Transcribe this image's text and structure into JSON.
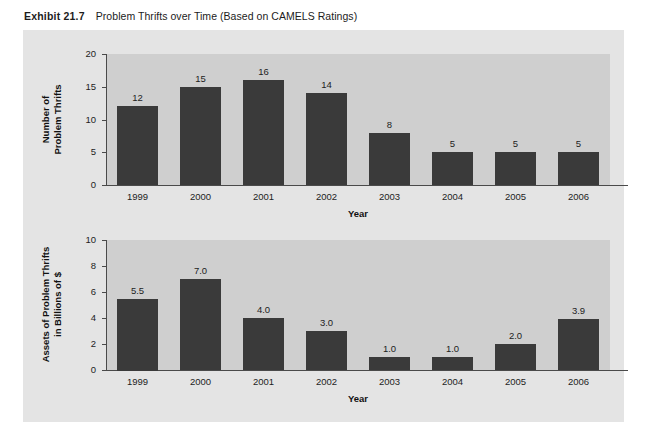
{
  "exhibit": {
    "number": "Exhibit 21.7",
    "caption": "Problem Thrifts over Time (Based on CAMELS Ratings)"
  },
  "colors": {
    "bar": "#3a3a3a",
    "panel_background": "#e4e4e4",
    "plot_background": "#cfcfcf",
    "axis": "#4a4a4a",
    "text": "#1d1d1d"
  },
  "chart_data": [
    {
      "type": "bar",
      "title": "",
      "xlabel": "Year",
      "ylabel": "Number of\nProblem Thrifts",
      "ylabel_line1": "Number of",
      "ylabel_line2": "Problem Thrifts",
      "categories": [
        "1999",
        "2000",
        "2001",
        "2002",
        "2003",
        "2004",
        "2005",
        "2006"
      ],
      "values": [
        12,
        15,
        16,
        14,
        8,
        5,
        5,
        5
      ],
      "value_labels": [
        "12",
        "15",
        "16",
        "14",
        "8",
        "5",
        "5",
        "5"
      ],
      "ylim": [
        0,
        20
      ],
      "yticks": [
        0,
        5,
        10,
        15,
        20
      ],
      "ytick_labels": [
        "0",
        "5",
        "10",
        "15",
        "20"
      ],
      "grid": false,
      "legend": "none"
    },
    {
      "type": "bar",
      "title": "",
      "xlabel": "Year",
      "ylabel": "Assets of Problem Thrifts\nin Billions of $",
      "ylabel_line1": "Assets of Problem Thrifts",
      "ylabel_line2": "in Billions of $",
      "categories": [
        "1999",
        "2000",
        "2001",
        "2002",
        "2003",
        "2004",
        "2005",
        "2006"
      ],
      "values": [
        5.5,
        7.0,
        4.0,
        3.0,
        1.0,
        1.0,
        2.0,
        3.9
      ],
      "value_labels": [
        "5.5",
        "7.0",
        "4.0",
        "3.0",
        "1.0",
        "1.0",
        "2.0",
        "3.9"
      ],
      "ylim": [
        0,
        10
      ],
      "yticks": [
        0,
        2,
        4,
        6,
        8,
        10
      ],
      "ytick_labels": [
        "0",
        "2",
        "4",
        "6",
        "8",
        "10"
      ],
      "grid": false,
      "legend": "none"
    }
  ]
}
